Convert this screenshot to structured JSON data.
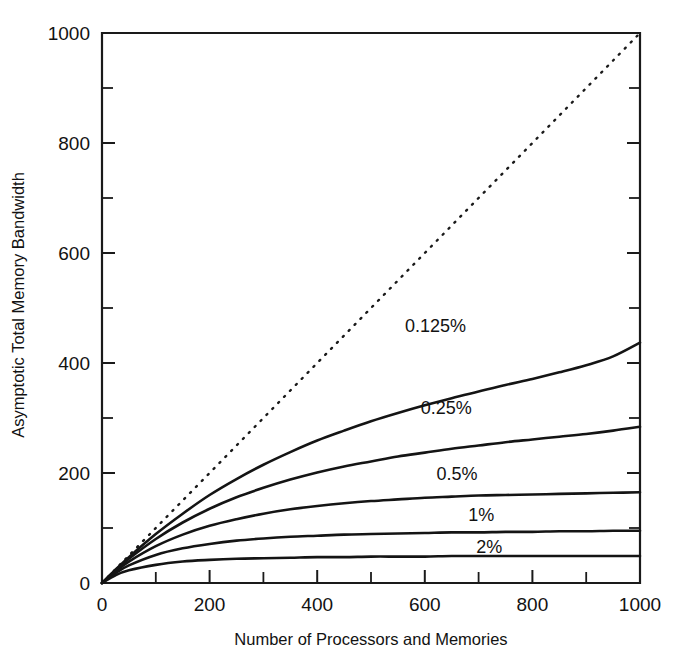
{
  "chart_data": {
    "type": "line",
    "title": "",
    "xlabel": "Number of Processors and Memories",
    "ylabel": "Asymptotic Total Memory Bandwidth",
    "xlim": [
      0,
      1000
    ],
    "ylim": [
      0,
      1000
    ],
    "grid": false,
    "legend_position": "inline-labels",
    "x_ticks_major": [
      0,
      200,
      400,
      600,
      800,
      1000
    ],
    "x_ticks_minor": [
      100,
      300,
      500,
      700,
      900
    ],
    "y_ticks_major": [
      0,
      200,
      400,
      600,
      800,
      1000
    ],
    "y_ticks_minor": [
      100,
      300,
      500,
      700,
      900
    ],
    "x_tick_labels": [
      "0",
      "200",
      "400",
      "600",
      "800",
      "1000"
    ],
    "y_tick_labels": [
      "0",
      "200",
      "400",
      "600",
      "800",
      "1000"
    ],
    "x": [
      0,
      25,
      50,
      100,
      150,
      200,
      250,
      300,
      350,
      400,
      450,
      500,
      550,
      600,
      650,
      700,
      750,
      800,
      850,
      900,
      950,
      1000
    ],
    "series": [
      {
        "name": "ideal",
        "label": "",
        "style": "dotted",
        "label_x": null,
        "label_y": null,
        "values": [
          0,
          25,
          50,
          100,
          150,
          200,
          250,
          300,
          350,
          400,
          450,
          500,
          550,
          600,
          650,
          700,
          750,
          800,
          850,
          900,
          950,
          1000
        ]
      },
      {
        "name": "0.125%",
        "label": "0.125%",
        "style": "solid",
        "label_x": 620,
        "label_y": 468,
        "values": [
          0,
          24,
          47,
          89,
          126,
          160,
          189,
          215,
          238,
          259,
          277,
          294,
          309,
          323,
          336,
          348,
          360,
          371,
          383,
          396,
          412,
          437
        ]
      },
      {
        "name": "0.25%",
        "label": "0.25%",
        "style": "solid",
        "label_x": 640,
        "label_y": 318,
        "values": [
          0,
          23,
          44,
          80,
          110,
          135,
          156,
          173,
          188,
          201,
          212,
          221,
          230,
          237,
          244,
          250,
          256,
          261,
          266,
          271,
          277,
          284
        ]
      },
      {
        "name": "0.5%",
        "label": "0.5%",
        "style": "solid",
        "label_x": 660,
        "label_y": 198,
        "values": [
          0,
          21,
          39,
          67,
          88,
          104,
          116,
          126,
          134,
          140,
          145,
          149,
          152,
          155,
          157,
          159,
          160,
          161,
          162,
          163,
          164,
          165
        ]
      },
      {
        "name": "1%",
        "label": "1%",
        "style": "solid",
        "label_x": 705,
        "label_y": 123,
        "values": [
          0,
          18,
          32,
          51,
          63,
          71,
          77,
          81,
          84,
          86,
          88,
          89,
          90,
          91,
          92,
          92,
          93,
          93,
          94,
          94,
          95,
          95
        ]
      },
      {
        "name": "2%",
        "label": "2%",
        "style": "solid",
        "label_x": 720,
        "label_y": 66,
        "values": [
          0,
          14,
          23,
          33,
          39,
          42,
          44,
          45,
          46,
          47,
          47,
          48,
          48,
          48,
          49,
          49,
          49,
          49,
          49,
          49,
          49,
          49
        ]
      }
    ]
  },
  "annotations": {
    "series_labels": [
      "0.125%",
      "0.25%",
      "0.5%",
      "1%",
      "2%"
    ]
  }
}
